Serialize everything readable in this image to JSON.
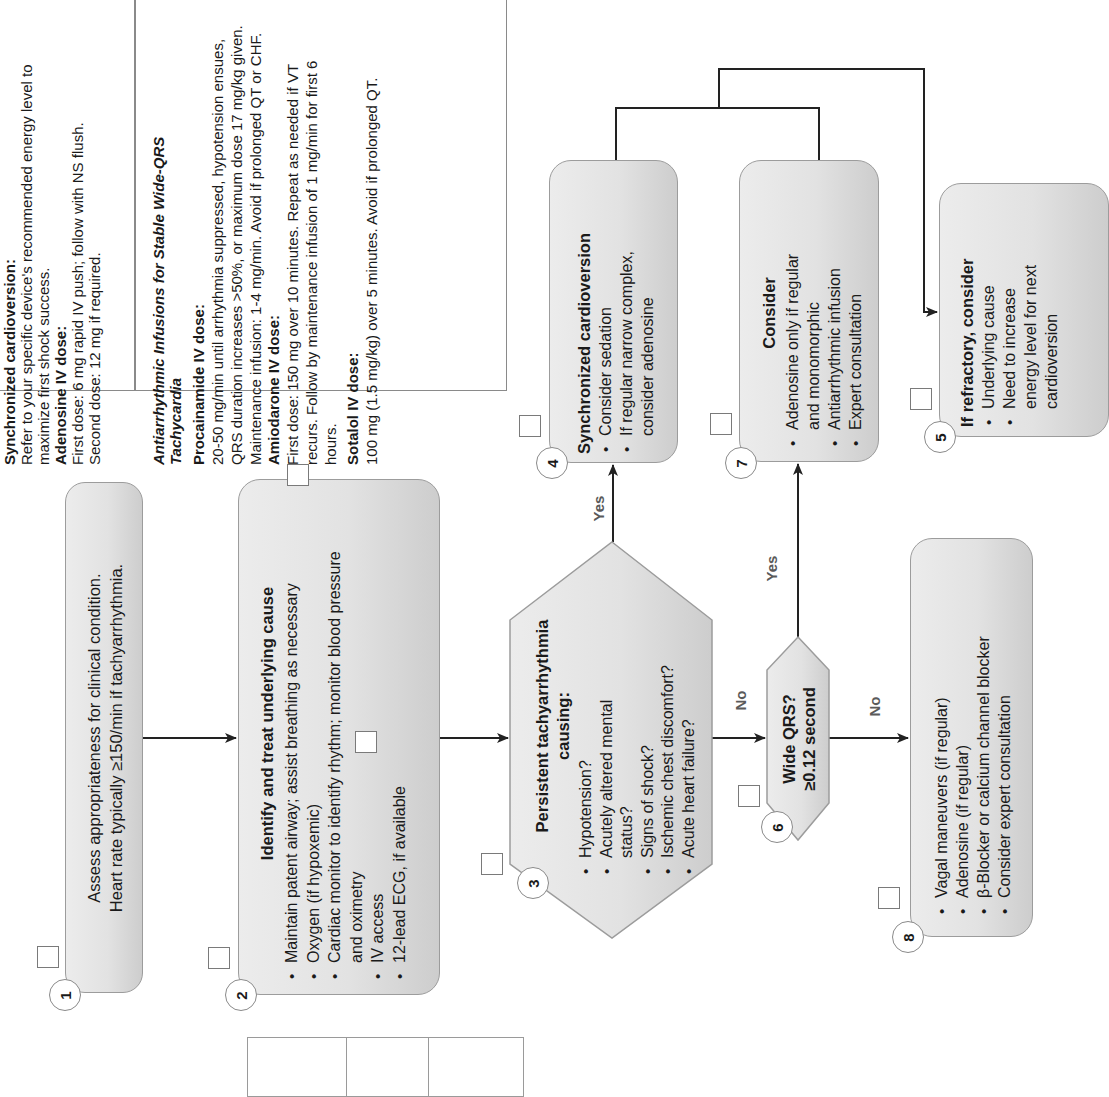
{
  "orientation": "rotated 90 degrees counterclockwise",
  "colors": {
    "box_fill_light": "#ececec",
    "box_fill_dark": "#cdcdcd",
    "box_border": "#9c9c9c",
    "line": "#222222",
    "label": "#5a5a5a"
  },
  "info_panel": {
    "section1": {
      "heading": "Synchronized cardioversion:",
      "text": "Refer to your specific device's recommended energy level to maximize first shock success.",
      "adenosine_heading": "Adenosine IV dose:",
      "adenosine_text_1": "First dose: 6 mg rapid IV push; follow with NS flush.",
      "adenosine_text_2": "Second dose: 12 mg if required."
    },
    "section2": {
      "heading": "Antiarrhythmic Infusions for Stable Wide-QRS Tachycardia",
      "procainamide_heading": "Procainamide IV dose:",
      "procainamide_text": "20-50 mg/min until arrhythmia suppressed, hypotension ensues, QRS duration increases >50%, or maximum dose 17 mg/kg given. Maintenance infusion: 1-4 mg/min. Avoid if prolonged QT or CHF.",
      "amiodarone_heading": "Amiodarone IV dose:",
      "amiodarone_text": "First dose: 150 mg over 10 minutes. Repeat as needed if VT recurs. Follow by maintenance infusion of 1 mg/min for first 6 hours.",
      "sotalol_heading": "Sotalol IV dose:",
      "sotalol_text": "100 mg (1.5 mg/kg) over 5 minutes. Avoid if prolonged QT."
    }
  },
  "nodes": {
    "n1": {
      "number": "1",
      "lines": [
        "Assess appropriateness for clinical condition.",
        "Heart rate typically ≥150/min if tachyarrhythmia."
      ]
    },
    "n2": {
      "number": "2",
      "title": "Identify and treat underlying cause",
      "items": [
        "Maintain patent airway; assist breathing as necessary",
        "Oxygen (if hypoxemic)",
        "Cardiac monitor to identify rhythm; monitor blood pressure and oximetry",
        "IV access",
        "12-lead ECG, if available"
      ]
    },
    "n3": {
      "number": "3",
      "title": "Persistent tachyarrhythmia causing:",
      "items": [
        "Hypotension?",
        "Acutely altered mental status?",
        "Signs of shock?",
        "Ischemic chest discomfort?",
        "Acute heart failure?"
      ]
    },
    "n4": {
      "number": "4",
      "title": "Synchronized cardioversion",
      "items": [
        "Consider sedation",
        "If regular narrow complex, consider adenosine"
      ]
    },
    "n5": {
      "number": "5",
      "title": "If refractory, consider",
      "items": [
        "Underlying cause",
        "Need to increase energy level for next cardioversion"
      ]
    },
    "n6": {
      "number": "6",
      "title_1": "Wide QRS?",
      "title_2": "≥0.12 second"
    },
    "n7": {
      "number": "7",
      "title": "Consider",
      "items": [
        "Adenosine only if regular and monomorphic",
        "Antiarrhythmic infusion",
        "Expert consultation"
      ]
    },
    "n8": {
      "number": "8",
      "items": [
        "Vagal maneuvers (if regular)",
        "Adenosine (if regular)",
        "β-Blocker or calcium channel blocker",
        "Consider expert consultation"
      ]
    }
  },
  "edge_labels": {
    "yes_3_4": "Yes",
    "no_3_6": "No",
    "yes_6_7": "Yes",
    "no_6_8": "No"
  },
  "checkboxes": 11,
  "table": {
    "columns": 3,
    "cells": [
      "",
      "",
      ""
    ]
  }
}
